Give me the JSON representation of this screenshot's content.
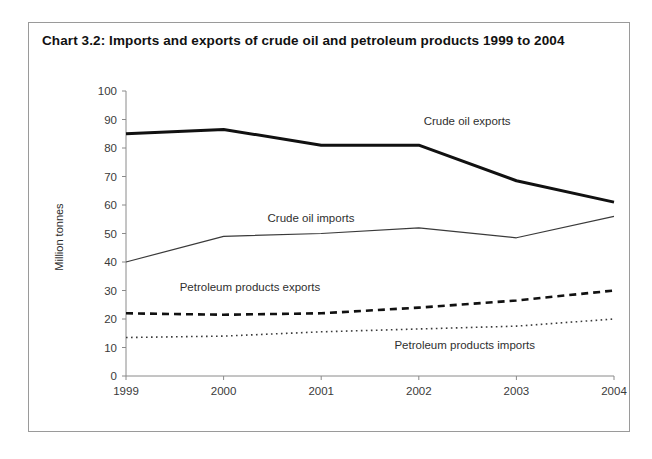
{
  "chart_title": "Chart 3.2:  Imports and exports of crude oil and petroleum products 1999 to 2004",
  "frame": {
    "border_color": "#9a9a9a",
    "background": "#ffffff"
  },
  "chart_data": {
    "type": "line",
    "title": "Chart 3.2:  Imports and exports of crude oil and petroleum products 1999 to 2004",
    "xlabel": "",
    "ylabel": "Million tonnes",
    "categories": [
      "1999",
      "2000",
      "2001",
      "2002",
      "2003",
      "2004"
    ],
    "x": [
      1999,
      2000,
      2001,
      2002,
      2003,
      2004
    ],
    "ylim": [
      0,
      100
    ],
    "yticks": [
      0,
      10,
      20,
      30,
      40,
      50,
      60,
      70,
      80,
      90,
      100
    ],
    "ytick_labels": [
      "0",
      "10",
      "20",
      "30",
      "40",
      "50",
      "60",
      "70",
      "80",
      "90",
      "100"
    ],
    "xtick_labels": [
      "1999",
      "2000",
      "2001",
      "2002",
      "2003",
      "2004"
    ],
    "grid": false,
    "legend": "inline-annotations",
    "series": [
      {
        "name": "Crude oil exports",
        "values": [
          85,
          86.5,
          81,
          81,
          68.5,
          61
        ],
        "style": "solid-thick",
        "color": "#111111",
        "width": 3,
        "label_x": 2002.05,
        "label_y": 89
      },
      {
        "name": "Crude oil imports",
        "values": [
          40,
          49,
          50,
          52,
          48.5,
          56
        ],
        "style": "solid-thin",
        "color": "#3a3a3a",
        "width": 1.2,
        "label_x": 2000.45,
        "label_y": 55
      },
      {
        "name": "Petroleum products exports",
        "values": [
          22,
          21.5,
          22,
          24,
          26.5,
          30
        ],
        "style": "dashed",
        "color": "#111111",
        "width": 2.6,
        "label_x": 1999.55,
        "label_y": 31
      },
      {
        "name": "Petroleum products imports",
        "values": [
          13.5,
          14,
          15.5,
          16.5,
          17.5,
          20
        ],
        "style": "dotted",
        "color": "#3a3a3a",
        "width": 1.6,
        "label_x": 2001.75,
        "label_y": 10.5
      }
    ]
  }
}
